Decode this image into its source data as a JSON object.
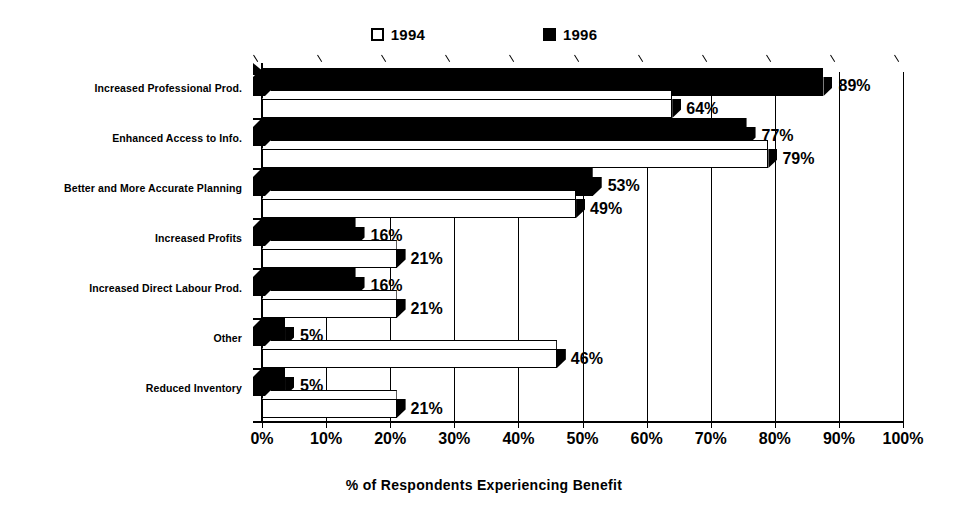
{
  "chart_data": {
    "type": "bar",
    "orientation": "horizontal",
    "title": "",
    "xlabel": "% of Respondents Experiencing Benefit",
    "ylabel": "",
    "xlim": [
      0,
      100
    ],
    "xtick_labels": [
      "0%",
      "10%",
      "20%",
      "30%",
      "40%",
      "50%",
      "60%",
      "70%",
      "80%",
      "90%",
      "100%"
    ],
    "xticks": [
      0,
      10,
      20,
      30,
      40,
      50,
      60,
      70,
      80,
      90,
      100
    ],
    "grid": true,
    "legend_position": "top-center",
    "categories": [
      "Increased Professional Prod.",
      "Enhanced Access to Info.",
      "Better and More Accurate Planning",
      "Increased Profits",
      "Increased Direct Labour Prod.",
      "Other",
      "Reduced Inventory"
    ],
    "series": [
      {
        "name": "1996",
        "color": "#000000",
        "style": "filled",
        "values": [
          89,
          77,
          53,
          16,
          16,
          5,
          5
        ],
        "value_labels": [
          "89%",
          "77%",
          "53%",
          "16%",
          "16%",
          "5%",
          "5%"
        ]
      },
      {
        "name": "1994",
        "color": "#ffffff",
        "style": "hollow",
        "values": [
          64,
          79,
          49,
          21,
          21,
          46,
          21
        ],
        "value_labels": [
          "64%",
          "79%",
          "49%",
          "21%",
          "21%",
          "46%",
          "21%"
        ]
      }
    ]
  },
  "legend": {
    "items": [
      {
        "label": "1994",
        "style": "hollow"
      },
      {
        "label": "1996",
        "style": "filled"
      }
    ]
  },
  "axis_title": "% of Respondents Experiencing Benefit"
}
